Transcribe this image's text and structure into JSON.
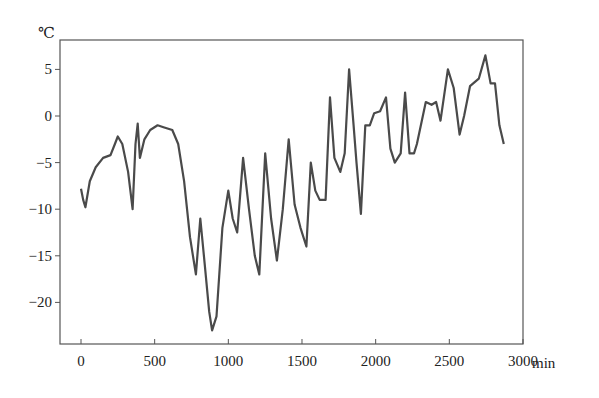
{
  "chart_data": {
    "type": "line",
    "title": "",
    "xlabel": "min",
    "ylabel": "℃",
    "xlim": [
      -100,
      3000
    ],
    "ylim": [
      -24.5,
      7.5
    ],
    "grid": false,
    "legend": null,
    "x_ticks": [
      0,
      500,
      1000,
      1500,
      2000,
      2500,
      3000
    ],
    "y_ticks": [
      5,
      0,
      -5,
      -10,
      -15,
      -20
    ],
    "x_tick_labels": [
      "0",
      "500",
      "1000",
      "1500",
      "2000",
      "2500",
      "3000"
    ],
    "y_tick_labels": [
      "5",
      "0",
      "−5",
      "−10",
      "−15",
      "−20"
    ],
    "line_color": "#4a4a4a",
    "series": [
      {
        "name": "temperature",
        "x": [
          0,
          15,
          30,
          60,
          100,
          150,
          200,
          230,
          250,
          280,
          320,
          350,
          370,
          385,
          400,
          430,
          470,
          520,
          560,
          620,
          660,
          700,
          740,
          780,
          810,
          840,
          870,
          890,
          920,
          960,
          1000,
          1030,
          1060,
          1100,
          1140,
          1180,
          1210,
          1250,
          1290,
          1330,
          1370,
          1410,
          1450,
          1490,
          1530,
          1560,
          1590,
          1620,
          1660,
          1690,
          1720,
          1760,
          1790,
          1820,
          1850,
          1870,
          1900,
          1930,
          1960,
          1990,
          2030,
          2070,
          2100,
          2130,
          2170,
          2200,
          2230,
          2260,
          2280,
          2340,
          2380,
          2410,
          2440,
          2490,
          2530,
          2570,
          2600,
          2640,
          2700,
          2745,
          2780,
          2810,
          2840,
          2870
        ],
        "values": [
          -7.8,
          -9,
          -9.8,
          -7,
          -5.5,
          -4.5,
          -4.2,
          -3,
          -2.2,
          -3,
          -6,
          -10,
          -3,
          -0.8,
          -4.5,
          -2.5,
          -1.5,
          -1,
          -1.2,
          -1.5,
          -3,
          -7,
          -13,
          -17,
          -11,
          -16,
          -21,
          -23,
          -21.5,
          -12,
          -8,
          -11,
          -12.5,
          -4.5,
          -10,
          -15,
          -17,
          -4,
          -11,
          -15.5,
          -10,
          -2.5,
          -9.5,
          -12,
          -14,
          -5,
          -8,
          -9,
          -9,
          2,
          -4.5,
          -6,
          -4,
          5,
          -1,
          -5,
          -10.5,
          -1,
          -1,
          0.3,
          0.5,
          2,
          -3.5,
          -5,
          -4,
          2.5,
          -4,
          -4,
          -3,
          1.5,
          1.2,
          1.5,
          -0.5,
          5,
          3,
          -2,
          0,
          3.2,
          4,
          6.5,
          3.5,
          3.5,
          -1,
          -3
        ]
      }
    ]
  }
}
